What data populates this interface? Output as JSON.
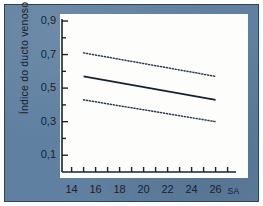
{
  "figure": {
    "background_color": "#5f80a0",
    "panel_color": "#fdfdfb",
    "frame_color": "#2f4356",
    "ink_color": "#16232e"
  },
  "chart_data": {
    "type": "line",
    "title": "",
    "subtitle": "",
    "xlabel": "",
    "ylabel": "Índice do ducto venoso",
    "x_unit_label": "SA",
    "xlim": [
      13.2,
      27.2
    ],
    "ylim": [
      0.0,
      0.9
    ],
    "xticks": [
      14,
      15,
      16,
      17,
      18,
      19,
      20,
      21,
      22,
      23,
      24,
      25,
      26,
      27
    ],
    "xtick_labels": [
      "14",
      "16",
      "18",
      "20",
      "22",
      "24",
      "26"
    ],
    "xtick_labels_at": [
      14,
      16,
      18,
      20,
      22,
      24,
      26
    ],
    "yticks": [
      0.1,
      0.2,
      0.3,
      0.4,
      0.5,
      0.6,
      0.7,
      0.8,
      0.9
    ],
    "ytick_labels": [
      "0,9",
      "0,7",
      "0,5",
      "0,3",
      "0,1"
    ],
    "ytick_labels_at": [
      0.9,
      0.7,
      0.5,
      0.3,
      0.1
    ],
    "grid": false,
    "legend": "none",
    "x": [
      15,
      26
    ],
    "series": [
      {
        "name": "upper bound",
        "style": "dotted",
        "color": "#2a3a48",
        "values": [
          0.71,
          0.57
        ]
      },
      {
        "name": "mean",
        "style": "solid",
        "color": "#16232e",
        "values": [
          0.57,
          0.43
        ]
      },
      {
        "name": "lower bound",
        "style": "dotted",
        "color": "#2a3a48",
        "values": [
          0.43,
          0.3
        ]
      }
    ]
  }
}
